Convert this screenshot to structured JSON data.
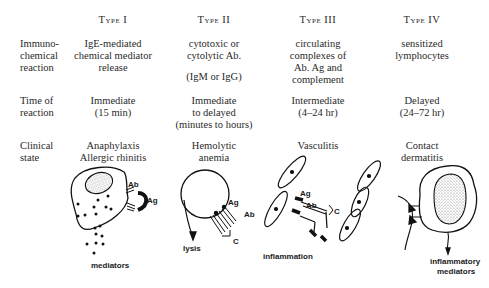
{
  "columns": [
    {
      "header": "Type I"
    },
    {
      "header": "Type II"
    },
    {
      "header": "Type III"
    },
    {
      "header": "Type IV"
    }
  ],
  "rows": [
    {
      "label": "Immuno-\nchemical\nreaction",
      "cells": [
        "IgE-mediated\nchemical mediator\nrelease",
        "cytotoxic or\ncytolytic Ab.",
        "circulating\ncomplexes of\nAb. Ag and\ncomplement",
        "sensitized\nlymphocytes"
      ],
      "type2_extra": "(IgM or IgG)"
    },
    {
      "label": "Time of\nreaction",
      "cells": [
        "Immediate\n(15 min)",
        "Immediate\nto delayed\n(minutes to hours)",
        "Intermediate\n(4–24 hr)",
        "Delayed\n(24–72 hr)"
      ]
    },
    {
      "label": "Clinical\nstate",
      "cells": [
        "Anaphylaxis\nAllergic rhinitis",
        "Hemolytic\nanemia",
        "Vasculitis",
        "Contact\ndermatitis"
      ]
    }
  ],
  "illustrations": {
    "type1": {
      "ab": "Ab",
      "ag": "Ag",
      "caption": "mediators",
      "icon": "mast-cell-icon"
    },
    "type2": {
      "ag": "Ag",
      "ab": "Ab",
      "c": "C",
      "caption": "lysis",
      "icon": "red-cell-lysis-icon"
    },
    "type3": {
      "ag": "Ag",
      "ab": "Ab",
      "c": "C",
      "caption": "inflammation",
      "icon": "immune-complex-vessel-icon"
    },
    "type4": {
      "caption_line1": "inflammatory",
      "caption_line2": "mediators",
      "icon": "lymphocyte-icon"
    }
  }
}
